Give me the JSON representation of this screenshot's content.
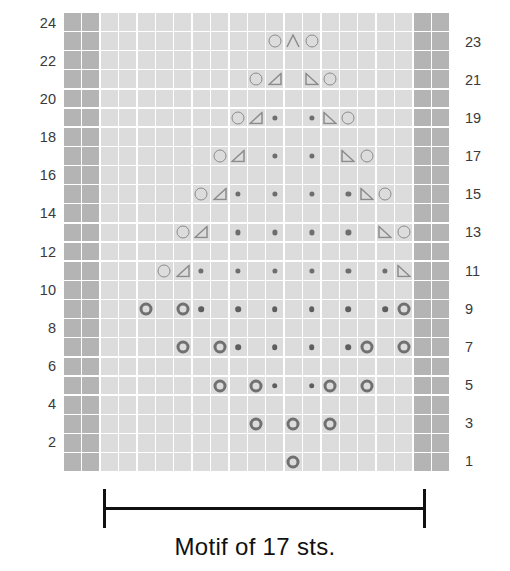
{
  "chart_data": {
    "type": "table",
    "title": "Motif of 17 sts.",
    "grid_columns": 21,
    "grid_rows": 24,
    "border_columns_each_side": 2,
    "motif_stitch_count": 17,
    "row_labels_left": [
      "24",
      "22",
      "20",
      "18",
      "16",
      "14",
      "12",
      "10",
      "8",
      "6",
      "4",
      "2"
    ],
    "row_labels_right": [
      "23",
      "21",
      "19",
      "17",
      "15",
      "13",
      "11",
      "9",
      "7",
      "5",
      "3",
      "1"
    ],
    "legend_symbols": [
      {
        "key": "yo",
        "glyph": "O",
        "name": "yarn-over-circle"
      },
      {
        "key": "yo_bold",
        "glyph": "O",
        "name": "yarn-over-circle-bold"
      },
      {
        "key": "dot",
        "glyph": "•",
        "name": "purl-dot"
      },
      {
        "key": "ssk",
        "glyph": "◿",
        "name": "left-leaning-decrease-triangle"
      },
      {
        "key": "k2tog",
        "glyph": "◺",
        "name": "right-leaning-decrease-triangle"
      },
      {
        "key": "cdd",
        "glyph": "∧",
        "name": "central-double-decrease-chevron"
      }
    ],
    "colors": {
      "cell": "#dcdcdc",
      "border_cell": "#b4b4b4",
      "symbol": "#8c8c8c",
      "symbol_bold": "#707070",
      "text": "#3a3a3a",
      "caption": "#111111"
    },
    "rows": [
      {
        "row": 24,
        "cells": []
      },
      {
        "row": 23,
        "cells": [
          {
            "c": 9,
            "s": "yo"
          },
          {
            "c": 10,
            "s": "cdd"
          },
          {
            "c": 11,
            "s": "yo"
          }
        ]
      },
      {
        "row": 22,
        "cells": []
      },
      {
        "row": 21,
        "cells": [
          {
            "c": 8,
            "s": "yo"
          },
          {
            "c": 9,
            "s": "ssk"
          },
          {
            "c": 11,
            "s": "k2tog"
          },
          {
            "c": 12,
            "s": "yo"
          }
        ]
      },
      {
        "row": 20,
        "cells": []
      },
      {
        "row": 19,
        "cells": [
          {
            "c": 7,
            "s": "yo"
          },
          {
            "c": 8,
            "s": "ssk"
          },
          {
            "c": 9,
            "s": "dot"
          },
          {
            "c": 11,
            "s": "dot"
          },
          {
            "c": 12,
            "s": "k2tog"
          },
          {
            "c": 13,
            "s": "yo"
          }
        ]
      },
      {
        "row": 18,
        "cells": []
      },
      {
        "row": 17,
        "cells": [
          {
            "c": 6,
            "s": "yo"
          },
          {
            "c": 7,
            "s": "ssk"
          },
          {
            "c": 9,
            "s": "dot"
          },
          {
            "c": 11,
            "s": "dot"
          },
          {
            "c": 13,
            "s": "k2tog"
          },
          {
            "c": 14,
            "s": "yo"
          }
        ]
      },
      {
        "row": 16,
        "cells": []
      },
      {
        "row": 15,
        "cells": [
          {
            "c": 5,
            "s": "yo"
          },
          {
            "c": 6,
            "s": "ssk"
          },
          {
            "c": 7,
            "s": "dot"
          },
          {
            "c": 9,
            "s": "dot"
          },
          {
            "c": 11,
            "s": "dot"
          },
          {
            "c": 13,
            "s": "dot"
          },
          {
            "c": 14,
            "s": "k2tog"
          },
          {
            "c": 15,
            "s": "yo"
          }
        ]
      },
      {
        "row": 14,
        "cells": []
      },
      {
        "row": 13,
        "cells": [
          {
            "c": 4,
            "s": "yo"
          },
          {
            "c": 5,
            "s": "ssk"
          },
          {
            "c": 7,
            "s": "dot"
          },
          {
            "c": 9,
            "s": "dot"
          },
          {
            "c": 11,
            "s": "dot"
          },
          {
            "c": 13,
            "s": "dot"
          },
          {
            "c": 15,
            "s": "k2tog"
          },
          {
            "c": 16,
            "s": "yo"
          }
        ]
      },
      {
        "row": 12,
        "cells": []
      },
      {
        "row": 11,
        "cells": [
          {
            "c": 3,
            "s": "yo"
          },
          {
            "c": 4,
            "s": "ssk"
          },
          {
            "c": 5,
            "s": "dot"
          },
          {
            "c": 7,
            "s": "dot"
          },
          {
            "c": 9,
            "s": "dot"
          },
          {
            "c": 11,
            "s": "dot"
          },
          {
            "c": 13,
            "s": "dot"
          },
          {
            "c": 15,
            "s": "dot"
          },
          {
            "c": 16,
            "s": "k2tog"
          },
          {
            "c": 17,
            "s": "yo"
          }
        ]
      },
      {
        "row": 10,
        "cells": []
      },
      {
        "row": 9,
        "cells": [
          {
            "c": 2,
            "s": "yo_bold"
          },
          {
            "c": 4,
            "s": "yo_bold"
          },
          {
            "c": 5,
            "s": "dot_bold"
          },
          {
            "c": 7,
            "s": "dot_bold"
          },
          {
            "c": 9,
            "s": "dot_bold"
          },
          {
            "c": 11,
            "s": "dot_bold"
          },
          {
            "c": 13,
            "s": "dot_bold"
          },
          {
            "c": 15,
            "s": "dot_bold"
          },
          {
            "c": 16,
            "s": "yo_bold"
          },
          {
            "c": 18,
            "s": "yo_bold"
          }
        ]
      },
      {
        "row": 8,
        "cells": []
      },
      {
        "row": 7,
        "cells": [
          {
            "c": 4,
            "s": "yo_bold"
          },
          {
            "c": 6,
            "s": "yo_bold"
          },
          {
            "c": 7,
            "s": "dot_bold"
          },
          {
            "c": 9,
            "s": "dot_bold"
          },
          {
            "c": 11,
            "s": "dot_bold"
          },
          {
            "c": 13,
            "s": "dot_bold"
          },
          {
            "c": 14,
            "s": "yo_bold"
          },
          {
            "c": 16,
            "s": "yo_bold"
          }
        ]
      },
      {
        "row": 6,
        "cells": []
      },
      {
        "row": 5,
        "cells": [
          {
            "c": 6,
            "s": "yo_bold"
          },
          {
            "c": 8,
            "s": "yo_bold"
          },
          {
            "c": 9,
            "s": "dot_bold"
          },
          {
            "c": 11,
            "s": "dot_bold"
          },
          {
            "c": 12,
            "s": "yo_bold"
          },
          {
            "c": 14,
            "s": "yo_bold"
          }
        ]
      },
      {
        "row": 4,
        "cells": []
      },
      {
        "row": 3,
        "cells": [
          {
            "c": 8,
            "s": "yo_bold"
          },
          {
            "c": 10,
            "s": "yo_bold"
          },
          {
            "c": 12,
            "s": "yo_bold"
          }
        ]
      },
      {
        "row": 2,
        "cells": []
      },
      {
        "row": 1,
        "cells": [
          {
            "c": 10,
            "s": "yo_bold"
          }
        ]
      }
    ]
  },
  "caption": {
    "text": "Motif of 17 sts."
  }
}
